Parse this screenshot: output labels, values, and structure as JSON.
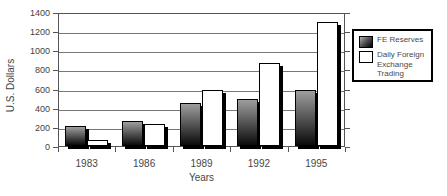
{
  "chart_data": {
    "type": "bar",
    "title": "",
    "xlabel": "Years",
    "ylabel": "U.S. Dollars",
    "categories": [
      "1983",
      "1986",
      "1989",
      "1992",
      "1995"
    ],
    "series": [
      {
        "name": "FE Reserves",
        "style": "gradient-dark",
        "values": [
          210,
          260,
          450,
          490,
          590
        ]
      },
      {
        "name": "Daily Foreign Exchange Trading",
        "style": "white",
        "values": [
          60,
          230,
          580,
          870,
          1300
        ]
      }
    ],
    "ylim": [
      0,
      1400
    ],
    "ytick_step": 200,
    "yticks": [
      "0",
      "200",
      "400",
      "600",
      "800",
      "1000",
      "1200",
      "1400"
    ],
    "grid": "horizontal",
    "legend_position": "right"
  },
  "legend": {
    "items": [
      {
        "label": "FE Reserves",
        "swatch": "gradient-dark"
      },
      {
        "label": "Daily Foreign Exchange Trading",
        "swatch": "white"
      }
    ]
  },
  "colors": {
    "background": "#ffffff",
    "bar_gradient_top": "#9e9e9e",
    "bar_gradient_bottom": "#0a0a0a",
    "bar_white": "#ffffff",
    "bar_border": "#000000",
    "bar_shadow": "#000000",
    "gridline": "#777777",
    "axis": "#555555",
    "text": "#3f3f3f",
    "legend_border": "#000000"
  }
}
